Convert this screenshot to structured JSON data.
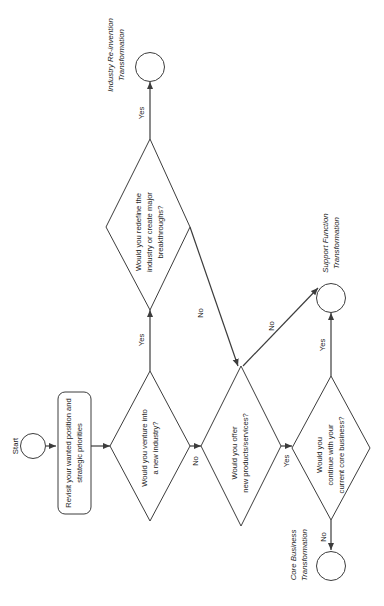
{
  "diagram": {
    "orientation": "rotated-90-ccw",
    "background_color": "#ffffff",
    "stroke_color": "#3c3c3c",
    "text_color": "#262626"
  },
  "start": {
    "label": "Start",
    "node_name": "start-terminator"
  },
  "process": {
    "line1": "Revisit your wanted position and",
    "line2": "strategic priorities"
  },
  "decisions": {
    "redefine": {
      "line1": "Would you redefine the",
      "line2": "industry or create major",
      "line3": "breakthroughs?"
    },
    "venture": {
      "line1": "Would you venture into",
      "line2": "a new industry?"
    },
    "offer": {
      "line1": "Would you offer",
      "line2": "new products/services?"
    },
    "core": {
      "line1": "Would you",
      "line2": "continue with your",
      "line3": "current core business?"
    }
  },
  "edges": {
    "venture_yes": "Yes",
    "venture_no": "No",
    "redefine_yes": "Yes",
    "redefine_no": "No",
    "offer_no": "No",
    "offer_yes": "Yes",
    "core_yes": "Yes",
    "core_no": "No"
  },
  "outcomes": {
    "industry": {
      "line1": "Industry Re-invention",
      "line2": "Transformation"
    },
    "support": {
      "line1": "Support Function",
      "line2": "Transformation"
    },
    "corebiz": {
      "line1": "Core Business",
      "line2": "Transformation"
    }
  }
}
